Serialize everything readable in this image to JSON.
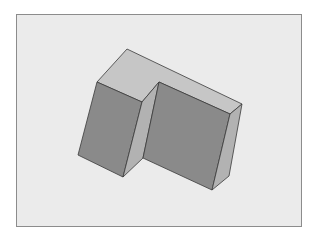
{
  "diagram": {
    "type": "isometric-3d-solid",
    "shape": "L-shaped block (stepped prism)",
    "colors": {
      "background": "#ebebeb",
      "frame_border": "#8c8c8c",
      "top_face": "#c6c6c6",
      "front_face": "#8a8a8a",
      "side_face": "#b2b2b2",
      "edge": "#3a3a3a"
    },
    "faces": {
      "top": "127,49 97,82 142,102 159,82 242,104 230,114 159,82",
      "top_main": "127,49 97,82 142,102 159,82 230,114 242,104",
      "left_front": "97,82 142,102 123,177 78,155",
      "left_side": "142,102 159,82 143,158 123,177",
      "right_front": "159,82 230,114 212,190 143,158",
      "right_side": "230,114 242,104 229,176 212,190"
    }
  }
}
